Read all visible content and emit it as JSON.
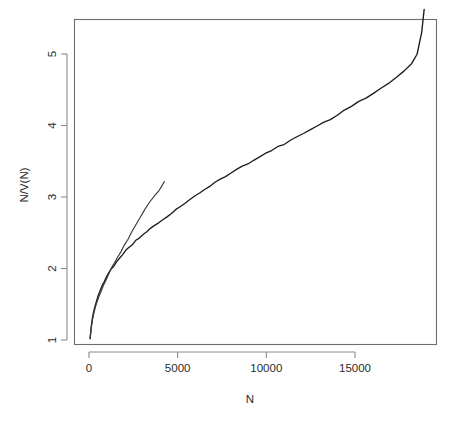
{
  "chart_data": {
    "type": "line",
    "title": "",
    "subtitle": "",
    "xlabel": "N",
    "ylabel": "N/V(N)",
    "xlim": [
      -1100,
      19700
    ],
    "ylim": [
      0.72,
      5.85
    ],
    "xticks": [
      0,
      5000,
      10000,
      15000
    ],
    "xticklabels": [
      "0",
      "5000",
      "10000",
      "15000"
    ],
    "yticks": [
      1,
      2,
      3,
      4,
      5
    ],
    "yticklabels": [
      "1",
      "2",
      "3",
      "4",
      "5"
    ],
    "grid": false,
    "legend": "none",
    "box": true,
    "series": [
      {
        "name": "full-range-curve",
        "note": "long curve spanning the whole N range",
        "x": [
          60,
          90,
          120,
          160,
          200,
          250,
          300,
          360,
          420,
          500,
          580,
          660,
          760,
          860,
          980,
          1100,
          1250,
          1400,
          1560,
          1720,
          1900,
          2080,
          2260,
          2450,
          2640,
          2840,
          3050,
          3260,
          3480,
          3700,
          3930,
          4160,
          4400,
          4650,
          4900,
          5160,
          5420,
          5690,
          5960,
          6240,
          6520,
          6810,
          7100,
          7400,
          7700,
          8010,
          8320,
          8640,
          8960,
          9290,
          9620,
          9960,
          10300,
          10650,
          11000,
          11360,
          11720,
          12090,
          12460,
          12840,
          13220,
          13610,
          14000,
          14400,
          14800,
          15210,
          15620,
          16040,
          16460,
          16890,
          17320,
          17760,
          18200,
          18500,
          18760,
          18900
        ],
        "y": [
          1.02,
          1.09,
          1.17,
          1.25,
          1.32,
          1.38,
          1.43,
          1.49,
          1.54,
          1.6,
          1.66,
          1.71,
          1.77,
          1.82,
          1.88,
          1.93,
          1.99,
          2.04,
          2.1,
          2.15,
          2.2,
          2.25,
          2.3,
          2.34,
          2.39,
          2.43,
          2.47,
          2.52,
          2.56,
          2.6,
          2.64,
          2.68,
          2.72,
          2.77,
          2.82,
          2.87,
          2.92,
          2.96,
          3.01,
          3.06,
          3.11,
          3.15,
          3.2,
          3.25,
          3.29,
          3.34,
          3.38,
          3.43,
          3.47,
          3.52,
          3.56,
          3.61,
          3.65,
          3.7,
          3.74,
          3.79,
          3.84,
          3.89,
          3.94,
          3.99,
          4.04,
          4.09,
          4.15,
          4.21,
          4.27,
          4.33,
          4.39,
          4.45,
          4.52,
          4.59,
          4.67,
          4.76,
          4.86,
          5.0,
          5.3,
          5.62
        ]
      },
      {
        "name": "short-range-curve",
        "note": "second curve diverging above, terminating near N=4250",
        "x": [
          60,
          100,
          150,
          210,
          280,
          360,
          450,
          560,
          680,
          810,
          950,
          1100,
          1260,
          1430,
          1610,
          1800,
          2000,
          2210,
          2430,
          2660,
          2900,
          3150,
          3410,
          3680,
          3960,
          4120,
          4250
        ],
        "y": [
          1.02,
          1.11,
          1.21,
          1.3,
          1.38,
          1.46,
          1.53,
          1.61,
          1.68,
          1.76,
          1.84,
          1.92,
          2.0,
          2.08,
          2.16,
          2.24,
          2.33,
          2.42,
          2.52,
          2.62,
          2.72,
          2.82,
          2.92,
          3.01,
          3.1,
          3.16,
          3.21
        ]
      }
    ]
  },
  "figure": {
    "background_color": "#ffffff",
    "line_color": "#1c1c1c",
    "axis_color": "#8a8a8a",
    "text_color": "#2b2b2b"
  }
}
